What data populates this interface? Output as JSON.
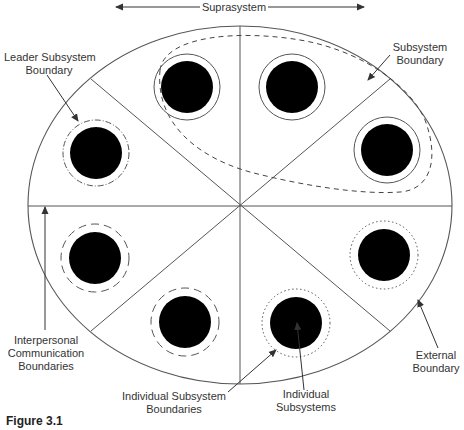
{
  "title": "Suprasystem",
  "labels": {
    "suprasystem": "Suprasystem",
    "leader_subsystem_boundary": [
      "Leader Subsystem",
      "Boundary"
    ],
    "subsystem_boundary": [
      "Subsystem",
      "Boundary"
    ],
    "interpersonal_communication_boundaries": [
      "Interpersonal",
      "Communication",
      "Boundaries"
    ],
    "individual_subsystem_boundaries": [
      "Individual Subsystem",
      "Boundaries"
    ],
    "individual_subsystems": [
      "Individual",
      "Subsystems"
    ],
    "external_boundary": [
      "External",
      "Boundary"
    ]
  },
  "caption": "Figure 3.1",
  "colors": {
    "line": "#555555",
    "fill": "#000000",
    "background": "#ffffff"
  },
  "diagram": {
    "external_boundary": {
      "cx": 240,
      "cy": 205,
      "rx": 212,
      "ry": 179
    },
    "sector_count": 8,
    "individuals": [
      {
        "id": "top-left",
        "cx": 187,
        "cy": 87,
        "boundary_style": "solid"
      },
      {
        "id": "top-right",
        "cx": 292,
        "cy": 87,
        "boundary_style": "solid"
      },
      {
        "id": "right-upper",
        "cx": 398,
        "cy": 150,
        "boundary_style": "solid"
      },
      {
        "id": "leader",
        "cx": 96,
        "cy": 153,
        "boundary_style": "dash-dot"
      },
      {
        "id": "left-lower",
        "cx": 95,
        "cy": 258,
        "boundary_style": "dashed"
      },
      {
        "id": "bottom-left",
        "cx": 185,
        "cy": 322,
        "boundary_style": "dashed"
      },
      {
        "id": "bottom-right",
        "cx": 296,
        "cy": 323,
        "boundary_style": "dotted"
      },
      {
        "id": "right-lower",
        "cx": 384,
        "cy": 255,
        "boundary_style": "dotted"
      }
    ]
  }
}
